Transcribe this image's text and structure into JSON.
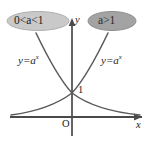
{
  "figure": {
    "type": "math-diagram",
    "background_color": "#ffffff",
    "curve_color": "#555555",
    "axis_color": "#4a4a4a"
  },
  "badges": {
    "left": {
      "text": "0<a<1",
      "fill": "#c9c9c9",
      "stroke": "#b0b0b0",
      "cx": 38,
      "cy": 21,
      "rx": 31,
      "ry": 9.5
    },
    "right": {
      "text": "a>1",
      "fill": "#a3a3a3",
      "stroke": "#8f8f8f",
      "cx": 112,
      "cy": 21,
      "rx": 24,
      "ry": 9.5
    }
  },
  "axes": {
    "x_label": "x",
    "y_label": "y",
    "origin_label": "O",
    "x_axis": {
      "x1": 10,
      "y1": 117,
      "x2": 142,
      "y2": 117
    },
    "y_axis": {
      "x1": 72,
      "y1": 20,
      "x2": 72,
      "y2": 136
    }
  },
  "curves": [
    {
      "name": "decreasing-exponential",
      "equation": "y=a^x",
      "condition": "0<a<1",
      "label": {
        "base": "y=a",
        "exponent": "x"
      },
      "path": "M 36 33 C 48 58, 60 80, 72 93 C 88 105, 110 112, 140 115"
    },
    {
      "name": "increasing-exponential",
      "equation": "y=a^x",
      "condition": "a>1",
      "label": {
        "base": "y=a",
        "exponent": "x"
      },
      "path": "M 108 33 C 96 58, 84 80, 72 93 C 56 105, 34 112, 11 115"
    }
  ],
  "points": {
    "y_intercept": {
      "label": "1",
      "x": 72,
      "y": 93
    }
  }
}
